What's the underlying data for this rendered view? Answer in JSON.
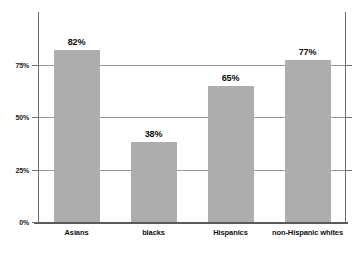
{
  "chart_data": {
    "type": "bar",
    "title": "",
    "subtitle": "",
    "xlabel": "",
    "ylabel": "",
    "categories": [
      "Asians",
      "blacks",
      "Hispanics",
      "non-Hispanic whites"
    ],
    "values": [
      82,
      38,
      65,
      77
    ],
    "value_labels": [
      "82%",
      "38%",
      "65%",
      "77%"
    ],
    "ylim": [
      0,
      100
    ],
    "yticks": [
      0,
      25,
      50,
      75
    ],
    "ytick_labels": [
      "0%",
      "25%",
      "50%",
      "75%"
    ],
    "grid": true,
    "legend": "none",
    "colors": {
      "bar_fill": "#adadad",
      "gridline": "#9a9a9a",
      "axis": "#6e6e6e",
      "baseline": "#5a5a5a",
      "text": "#101010",
      "background": "#ffffff"
    }
  }
}
